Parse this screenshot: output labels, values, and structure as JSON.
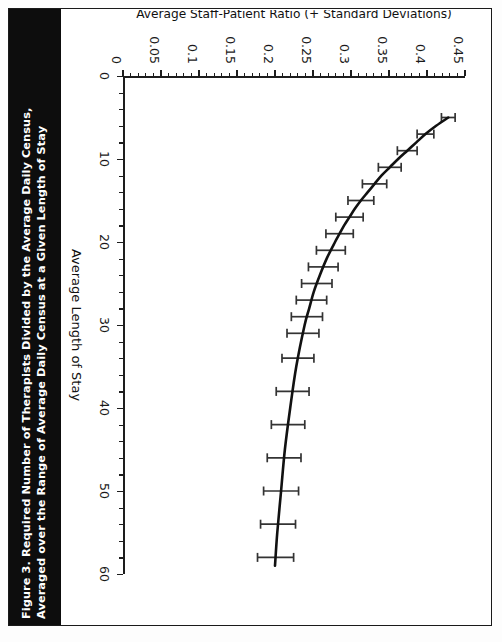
{
  "figure": {
    "title": "Figure 3.  Required Number of Therapists Divided by the Average Daily Census,\nAveraged over the Range of Average Daily Census at a Given Length of Stay",
    "title_number": "Figure 3.",
    "orientation": "landscape-rotated-90"
  },
  "chart_data": {
    "type": "line",
    "title": "Required Number of Therapists Divided by the Average Daily Census, Averaged over the Range of Average Daily Census at a Given Length of Stay",
    "xlabel": "Average Length of Stay",
    "ylabel": "Average Staff-Patient Ratio (+ Standard Deviations)",
    "xlim": [
      0,
      60
    ],
    "ylim": [
      0,
      0.45
    ],
    "xticks": [
      0,
      10,
      20,
      30,
      40,
      50,
      60
    ],
    "xtick_labels": [
      "0",
      "10",
      "20",
      "30",
      "40",
      "50",
      "60"
    ],
    "x_minor_step": 2,
    "yticks": [
      0,
      0.05,
      0.1,
      0.15,
      0.2,
      0.25,
      0.3,
      0.35,
      0.4,
      0.45
    ],
    "ytick_labels": [
      "0",
      "0.05",
      "0.1",
      "0.15",
      "0.2",
      "0.25",
      "0.3",
      "0.35",
      "0.4",
      "0.45"
    ],
    "y_minor_step": 0.01,
    "grid": false,
    "legend": null,
    "line_color": "#111111",
    "line_width_px": 2.6,
    "errorbar_color": "#333333",
    "errorbar_cap_width_px": 9,
    "x": [
      5,
      6,
      7,
      8,
      9,
      10,
      11,
      12,
      13,
      14,
      15,
      16,
      17,
      18,
      19,
      20,
      22,
      24,
      26,
      28,
      30,
      35,
      40,
      45,
      50,
      55,
      59
    ],
    "values": [
      0.428,
      0.412,
      0.398,
      0.386,
      0.374,
      0.362,
      0.351,
      0.34,
      0.331,
      0.322,
      0.313,
      0.305,
      0.298,
      0.291,
      0.285,
      0.279,
      0.268,
      0.259,
      0.251,
      0.245,
      0.239,
      0.228,
      0.22,
      0.213,
      0.208,
      0.203,
      0.2
    ],
    "errors": [
      0.009,
      0.01,
      0.011,
      0.012,
      0.013,
      0.014,
      0.015,
      0.015,
      0.016,
      0.016,
      0.017,
      0.017,
      0.018,
      0.018,
      0.018,
      0.019,
      0.019,
      0.02,
      0.02,
      0.02,
      0.021,
      0.021,
      0.022,
      0.022,
      0.023,
      0.023,
      0.024
    ],
    "errorbar_x": [
      5,
      7,
      9,
      11,
      13,
      15,
      17,
      19,
      21,
      23,
      25,
      27,
      29,
      31,
      34,
      38,
      42,
      46,
      50,
      54,
      58
    ],
    "note": "Monotonically decreasing convex curve; staff-patient ratio falls steeply from ~0.43 at LOS 5 to ~0.20 by LOS 60, with vertical +/- standard deviation bars that widen slightly at longer stays."
  }
}
